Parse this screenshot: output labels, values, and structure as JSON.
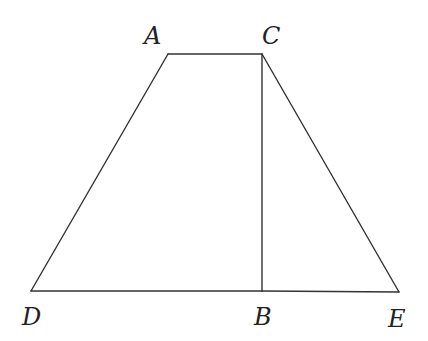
{
  "diagram": {
    "type": "geometry",
    "stroke_color": "#333333",
    "label_color": "#222222",
    "points": {
      "A": {
        "x": 168,
        "y": 54
      },
      "C": {
        "x": 262,
        "y": 54
      },
      "D": {
        "x": 31,
        "y": 291
      },
      "B": {
        "x": 262,
        "y": 291
      },
      "E": {
        "x": 399,
        "y": 292
      }
    },
    "segments": [
      {
        "from": "A",
        "to": "C"
      },
      {
        "from": "A",
        "to": "D"
      },
      {
        "from": "C",
        "to": "E"
      },
      {
        "from": "C",
        "to": "B"
      },
      {
        "from": "D",
        "to": "B"
      },
      {
        "from": "B",
        "to": "E"
      }
    ],
    "labels": {
      "A": {
        "text": "A",
        "x": 144,
        "y": 44
      },
      "C": {
        "text": "C",
        "x": 262,
        "y": 44
      },
      "D": {
        "text": "D",
        "x": 22,
        "y": 325
      },
      "B": {
        "text": "B",
        "x": 254,
        "y": 325
      },
      "E": {
        "text": "E",
        "x": 388,
        "y": 327
      }
    }
  }
}
